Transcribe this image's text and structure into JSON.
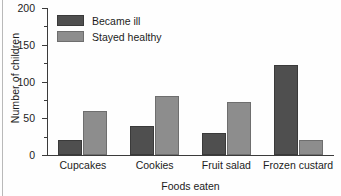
{
  "chart_data": {
    "type": "bar",
    "title": "",
    "xlabel": "Foods eaten",
    "ylabel": "Number of children",
    "categories": [
      "Cupcakes",
      "Cookies",
      "Fruit salad",
      "Frozen custard"
    ],
    "series": [
      {
        "name": "Became ill",
        "color": "#4f4f4f",
        "values": [
          20,
          40,
          30,
          122
        ]
      },
      {
        "name": "Stayed healthy",
        "color": "#8d8d8d",
        "values": [
          60,
          80,
          72,
          20
        ]
      }
    ],
    "ylim": [
      0,
      200
    ],
    "yticks": [
      0,
      50,
      100,
      150,
      200
    ],
    "ytick_labels": [
      "0",
      "50",
      "100",
      "150",
      "200"
    ],
    "yminor_ticks": [
      25,
      75,
      125,
      175
    ],
    "grid": false,
    "legend_position": "upper-left"
  }
}
